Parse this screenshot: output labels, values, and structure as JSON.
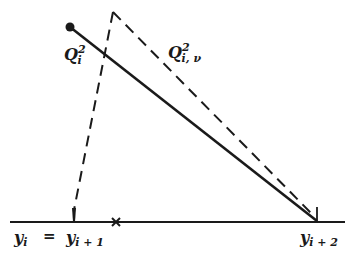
{
  "diagram": {
    "colors": {
      "line": "#1a1a1a",
      "background": "#ffffff"
    },
    "labels": {
      "q_i_sq": {
        "base": "Q",
        "sub": "i",
        "sup": "2"
      },
      "q_i_nu_sq": {
        "base": "Q",
        "sub": "i, ν",
        "sup": "2"
      },
      "y_i": {
        "base": "y",
        "sub": "i"
      },
      "equals": "=",
      "y_i_plus_1": {
        "base": "y",
        "sub": "i + 1"
      },
      "y_i_plus_2": {
        "base": "y",
        "sub": "i + 2"
      }
    },
    "markers": {
      "start_point": "filled-dot",
      "midpoint": "x-mark"
    }
  }
}
